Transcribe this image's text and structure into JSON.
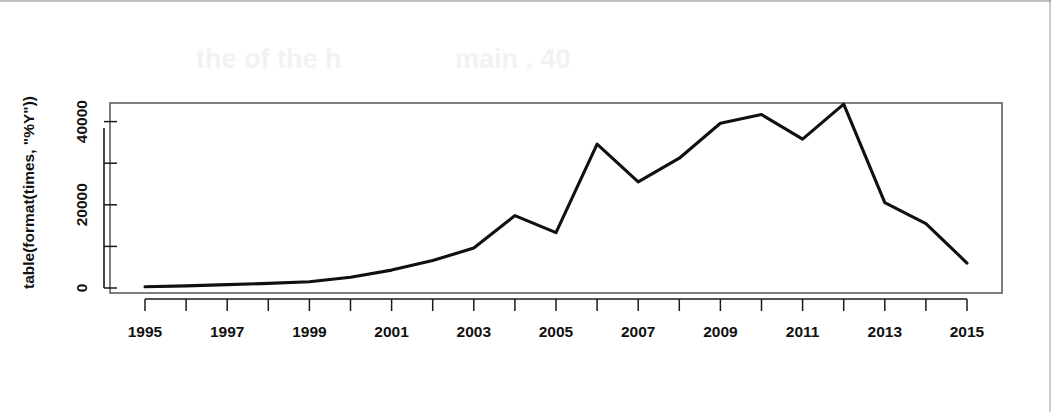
{
  "figure": {
    "background_color": "#ffffff",
    "line_color": "#101010",
    "axis_color": "#1a1a1a",
    "box_color": "#555555"
  },
  "chart_data": {
    "type": "line",
    "title": "",
    "xlabel": "",
    "ylabel": "table(format(times, \"%Y\"))",
    "x": [
      1995,
      1996,
      1997,
      1998,
      1999,
      2000,
      2001,
      2002,
      2003,
      2004,
      2005,
      2006,
      2007,
      2008,
      2009,
      2010,
      2011,
      2012,
      2013,
      2014,
      2015
    ],
    "values": [
      300,
      500,
      800,
      1100,
      1500,
      2600,
      4300,
      6600,
      9600,
      17400,
      13300,
      34600,
      25500,
      31200,
      39600,
      41700,
      35800,
      44200,
      20500,
      15500,
      6000
    ],
    "xlim": [
      1994.2,
      2015.85
    ],
    "ylim": [
      -1200,
      46500
    ],
    "xticks": [
      1995,
      1996,
      1997,
      1998,
      1999,
      2000,
      2001,
      2002,
      2003,
      2004,
      2005,
      2006,
      2007,
      2008,
      2009,
      2010,
      2011,
      2012,
      2013,
      2014,
      2015
    ],
    "xticklabels": [
      "1995",
      "",
      "1997",
      "",
      "1999",
      "",
      "2001",
      "",
      "2003",
      "",
      "2005",
      "",
      "2007",
      "",
      "2009",
      "",
      "2011",
      "",
      "2013",
      "",
      "2015"
    ],
    "yticks": [
      0,
      10000,
      20000,
      30000,
      40000
    ],
    "yticklabels": [
      "0",
      "",
      "20000",
      "",
      "40000"
    ],
    "grid": false,
    "legend": false
  },
  "ghost_text": {
    "fragment_left": "the of the h",
    "fragment_right": "main . 40"
  }
}
